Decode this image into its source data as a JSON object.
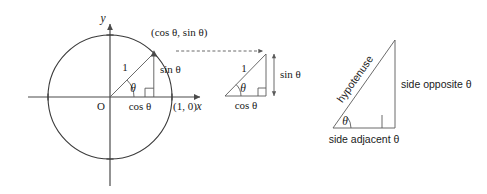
{
  "figure": {
    "title_visible": false,
    "background_color": "#ffffff",
    "line_color": "#3a3a3a",
    "text_color": "#1a1a1a"
  },
  "unit_circle": {
    "name": "unit-circle-diagram",
    "axis_labels": {
      "x": "x",
      "y": "y"
    },
    "origin_label": "O",
    "point_on_axis_label": "(1, 0)",
    "point_on_circle_label": "(cos θ, sin θ)",
    "radius_label": "1",
    "angle_label": "θ",
    "horizontal_leg_label": "cos θ",
    "vertical_leg_label": "sin θ",
    "radius_px": 62,
    "angle_degrees": 45,
    "center_px": {
      "x": 110,
      "y": 97
    }
  },
  "small_triangle": {
    "name": "small-right-triangle",
    "hypotenuse_label": "1",
    "angle_label": "θ",
    "adjacent_label": "cos θ",
    "opposite_label": "sin θ"
  },
  "large_triangle": {
    "name": "large-right-triangle",
    "hypotenuse_label": "hypotenuse",
    "angle_label": "θ",
    "adjacent_label": "side adjacent θ",
    "opposite_label": "side opposite θ"
  },
  "connector": {
    "name": "dashed-connector-arrow",
    "style": "dashed-arrow"
  }
}
